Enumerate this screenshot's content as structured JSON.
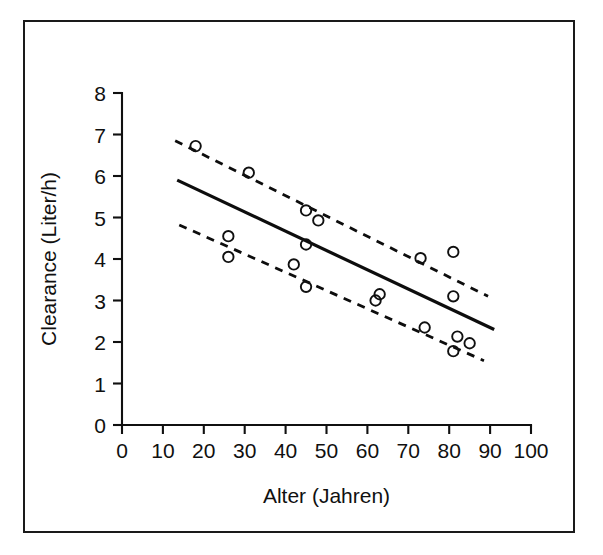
{
  "figure": {
    "background_color": "#ffffff",
    "border_color": "#1a1a1a",
    "ink_color": "#101010"
  },
  "chart_data": {
    "type": "scatter",
    "title": "",
    "subtitle": "",
    "xlabel": "Alter (Jahren)",
    "ylabel": "Clearance (Liter/h)",
    "xlim": [
      0,
      100
    ],
    "ylim": [
      0,
      8
    ],
    "xticks": [
      0,
      10,
      20,
      30,
      40,
      50,
      60,
      70,
      80,
      90,
      100
    ],
    "yticks": [
      0,
      1,
      2,
      3,
      4,
      5,
      6,
      7,
      8
    ],
    "xtick_labels": [
      "0",
      "10",
      "20",
      "30",
      "40",
      "50",
      "60",
      "70",
      "80",
      "90",
      "100"
    ],
    "ytick_labels": [
      "0",
      "1",
      "2",
      "3",
      "4",
      "5",
      "6",
      "7",
      "8"
    ],
    "grid": false,
    "legend": null,
    "legend_position": "none",
    "marker_style": "open-circle",
    "series": [
      {
        "name": "Clearance vs Alter",
        "kind": "scatter",
        "x": [
          18,
          31,
          45,
          48,
          26,
          45,
          26,
          73,
          81,
          42,
          45,
          63,
          62,
          81,
          74,
          82,
          85,
          81
        ],
        "y": [
          6.72,
          6.08,
          5.17,
          4.93,
          4.55,
          4.35,
          4.05,
          4.02,
          4.17,
          3.87,
          3.33,
          3.15,
          3.0,
          3.1,
          2.35,
          2.13,
          1.97,
          1.78
        ]
      },
      {
        "name": "Regressionsgerade",
        "kind": "line",
        "style": "solid",
        "x": [
          13.5,
          91.0
        ],
        "y": [
          5.9,
          2.3
        ]
      },
      {
        "name": "Oberes Konfidenzintervall",
        "kind": "line",
        "style": "dashed",
        "x": [
          13.0,
          89.5
        ],
        "y": [
          6.85,
          3.1
        ]
      },
      {
        "name": "Unteres Konfidenzintervall",
        "kind": "line",
        "style": "dashed",
        "x": [
          14.0,
          88.5
        ],
        "y": [
          4.82,
          1.55
        ]
      }
    ]
  }
}
